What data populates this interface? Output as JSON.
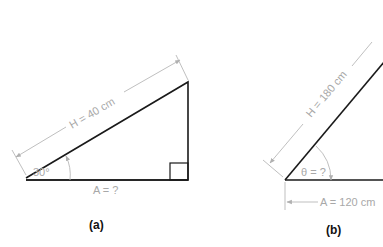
{
  "figure_a": {
    "caption": "(a)",
    "hypotenuse_label": "H = 40 cm",
    "angle_label": "30°",
    "adjacent_label": "A = ?",
    "has_right_angle_marker": true
  },
  "figure_b": {
    "caption": "(b)",
    "hypotenuse_label": "H = 180 cm",
    "angle_label": "θ = ?",
    "adjacent_label": "A = 120 cm"
  },
  "colors": {
    "edge": "#1a1a1a",
    "dimension": "#b8b8b8",
    "label": "#a8a8a8"
  }
}
